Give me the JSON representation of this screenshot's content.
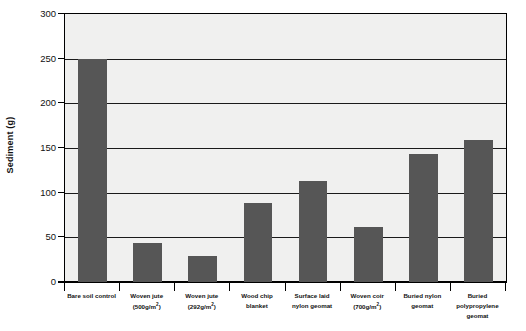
{
  "chart_data": {
    "type": "bar",
    "title": "",
    "xlabel": "",
    "ylabel": "Sediment (g)",
    "ylim": [
      0,
      300
    ],
    "ytick_step": 50,
    "yticks": [
      0,
      50,
      100,
      150,
      200,
      250,
      300
    ],
    "ytick_labels": [
      "0",
      "50",
      "100",
      "150",
      "200",
      "250",
      "300"
    ],
    "grid": true,
    "legend": "none",
    "bar_color": "#565656",
    "plot_background": "#f0f0ef",
    "axis_color": "#000000",
    "categories": [
      "Bare soil control",
      "Woven jute (500g/m2)",
      "Woven jute (292g/m2)",
      "Wood chip blanket",
      "Surface laid nylon geomat",
      "Woven coir (700g/m2)",
      "Buried nylon geomat",
      "Buried polypropylene geomat"
    ],
    "category_lines": [
      [
        "Bare soil control"
      ],
      [
        "Woven jute",
        "(500g/m2)"
      ],
      [
        "Woven jute",
        "(292g/m2)"
      ],
      [
        "Wood chip",
        "blanket"
      ],
      [
        "Surface laid",
        "nylon geomat"
      ],
      [
        "Woven coir",
        "(700g/m2)"
      ],
      [
        "Buried nylon",
        "geomat"
      ],
      [
        "Buried",
        "polypropylene",
        "geomat"
      ]
    ],
    "values": [
      250,
      44,
      29,
      88,
      113,
      62,
      143,
      159
    ]
  }
}
